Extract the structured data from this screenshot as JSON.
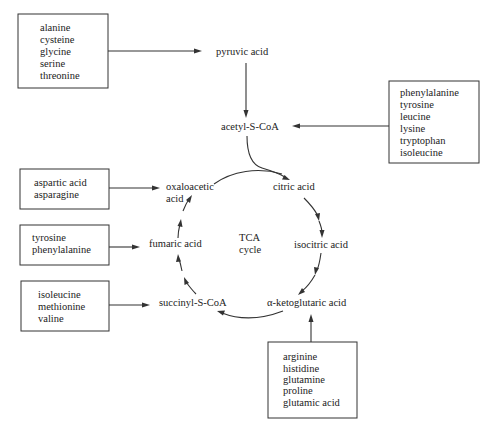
{
  "diagram": {
    "center_label": [
      "TCA",
      "cycle"
    ],
    "nodes": {
      "pyruvic_acid": "pyruvic acid",
      "acetyl_s_coa": "acetyl-S-CoA",
      "citric_acid": "citric acid",
      "isocitric_acid": "isocitric acid",
      "alpha_ketoglutaric_acid": "α-ketoglutaric acid",
      "succinyl_s_coa": "succinyl-S-CoA",
      "fumaric_acid": "fumaric acid",
      "oxaloacetic_acid": [
        "oxaloacetic",
        "acid"
      ]
    },
    "boxes": {
      "to_pyruvic": [
        "alanine",
        "cysteine",
        "glycine",
        "serine",
        "threonine"
      ],
      "to_acetyl": [
        "phenylalanine",
        "tyrosine",
        "leucine",
        "lysine",
        "tryptophan",
        "isoleucine"
      ],
      "to_oxaloacetic": [
        "aspartic acid",
        "asparagine"
      ],
      "to_fumaric": [
        "tyrosine",
        "phenylalanine"
      ],
      "to_succinyl": [
        "isoleucine",
        "methionine",
        "valine"
      ],
      "to_ketoglutaric": [
        "arginine",
        "histidine",
        "glutamine",
        "proline",
        "glutamic acid"
      ]
    },
    "cycle_order": [
      "citric acid",
      "isocitric acid",
      "α-ketoglutaric acid",
      "succinyl-S-CoA",
      "fumaric acid",
      "oxaloacetic acid"
    ]
  }
}
